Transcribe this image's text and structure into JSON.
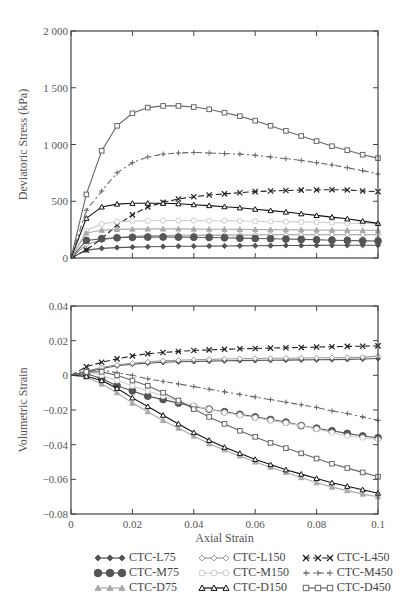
{
  "chart_data": [
    {
      "type": "line",
      "title": "",
      "xlabel": "",
      "ylabel": "Deviatoric Stress (kPa)",
      "xlim": [
        0,
        0.1
      ],
      "ylim": [
        0,
        2000
      ],
      "yticks": [
        0,
        500,
        1000,
        1500,
        2000
      ],
      "ytick_labels": [
        "0",
        "500",
        "1 000",
        "1 500",
        "2 000"
      ],
      "xticks": [
        0,
        0.02,
        0.04,
        0.06,
        0.08,
        0.1
      ],
      "grid": false,
      "x": [
        0,
        0.005,
        0.01,
        0.015,
        0.02,
        0.025,
        0.03,
        0.035,
        0.04,
        0.045,
        0.05,
        0.055,
        0.06,
        0.065,
        0.07,
        0.075,
        0.08,
        0.085,
        0.09,
        0.095,
        0.1
      ],
      "series": [
        {
          "name": "CTC-L75",
          "values": [
            0,
            70,
            85,
            92,
            96,
            99,
            101,
            103,
            104,
            105,
            106,
            107,
            108,
            109,
            110,
            110,
            111,
            112,
            112,
            113,
            113
          ]
        },
        {
          "name": "CTC-L150",
          "values": [
            0,
            120,
            160,
            180,
            190,
            195,
            198,
            200,
            201,
            202,
            202,
            203,
            203,
            204,
            204,
            204,
            205,
            205,
            205,
            205,
            205
          ]
        },
        {
          "name": "CTC-L450",
          "values": [
            0,
            70,
            170,
            290,
            380,
            450,
            490,
            520,
            540,
            555,
            565,
            575,
            585,
            590,
            595,
            598,
            600,
            602,
            600,
            590,
            585
          ]
        },
        {
          "name": "CTC-M75",
          "values": [
            0,
            155,
            170,
            178,
            182,
            184,
            185,
            184,
            183,
            181,
            178,
            175,
            172,
            170,
            167,
            164,
            160,
            157,
            154,
            151,
            150
          ]
        },
        {
          "name": "CTC-M150",
          "values": [
            0,
            240,
            300,
            320,
            325,
            328,
            330,
            330,
            330,
            329,
            328,
            326,
            324,
            322,
            320,
            318,
            315,
            312,
            308,
            305,
            300
          ]
        },
        {
          "name": "CTC-M450",
          "values": [
            0,
            420,
            590,
            750,
            840,
            890,
            915,
            925,
            930,
            925,
            920,
            915,
            905,
            890,
            875,
            860,
            840,
            820,
            795,
            770,
            740
          ]
        },
        {
          "name": "CTC-D75",
          "values": [
            0,
            220,
            245,
            252,
            255,
            256,
            256,
            256,
            255,
            254,
            253,
            252,
            251,
            250,
            249,
            248,
            247,
            246,
            245,
            244,
            243
          ]
        },
        {
          "name": "CTC-D150",
          "values": [
            0,
            350,
            450,
            475,
            482,
            483,
            482,
            478,
            470,
            462,
            452,
            442,
            430,
            418,
            405,
            390,
            375,
            360,
            345,
            325,
            305
          ]
        },
        {
          "name": "CTC-D450",
          "values": [
            0,
            560,
            945,
            1165,
            1275,
            1325,
            1340,
            1340,
            1330,
            1310,
            1280,
            1250,
            1210,
            1165,
            1120,
            1075,
            1030,
            985,
            950,
            910,
            880
          ]
        }
      ]
    },
    {
      "type": "line",
      "title": "",
      "xlabel": "Axial Strain",
      "ylabel": "Volumetric Strain",
      "xlim": [
        0,
        0.1
      ],
      "ylim": [
        -0.08,
        0.04
      ],
      "yticks": [
        -0.08,
        -0.06,
        -0.04,
        -0.02,
        0,
        0.02,
        0.04
      ],
      "ytick_labels": [
        "−0.08",
        "−0.06",
        "−0.04",
        "−0.02",
        "0",
        "0.02",
        "0.04"
      ],
      "xticks": [
        0,
        0.02,
        0.04,
        0.06,
        0.08,
        0.1
      ],
      "xtick_labels": [
        "0",
        "0.02",
        "0.04",
        "0.06",
        "0.08",
        "0.1"
      ],
      "grid": false,
      "x": [
        0,
        0.005,
        0.01,
        0.015,
        0.02,
        0.025,
        0.03,
        0.035,
        0.04,
        0.045,
        0.05,
        0.055,
        0.06,
        0.065,
        0.07,
        0.075,
        0.08,
        0.085,
        0.09,
        0.095,
        0.1
      ],
      "series": [
        {
          "name": "CTC-L75",
          "values": [
            0,
            0.002,
            0.004,
            0.0055,
            0.0065,
            0.007,
            0.0075,
            0.0078,
            0.008,
            0.0082,
            0.0084,
            0.0085,
            0.0086,
            0.0087,
            0.0088,
            0.0089,
            0.009,
            0.0091,
            0.0092,
            0.0094,
            0.0097
          ]
        },
        {
          "name": "CTC-L150",
          "values": [
            0,
            0.0025,
            0.0045,
            0.006,
            0.007,
            0.0078,
            0.0083,
            0.0087,
            0.009,
            0.0092,
            0.0094,
            0.0096,
            0.0097,
            0.0098,
            0.0099,
            0.01,
            0.0101,
            0.0102,
            0.0103,
            0.0105,
            0.011
          ]
        },
        {
          "name": "CTC-L450",
          "values": [
            0,
            0.005,
            0.0075,
            0.0095,
            0.0112,
            0.0125,
            0.0132,
            0.0138,
            0.0143,
            0.0147,
            0.015,
            0.0153,
            0.0155,
            0.0157,
            0.0159,
            0.0161,
            0.0163,
            0.0165,
            0.0167,
            0.0168,
            0.017
          ]
        },
        {
          "name": "CTC-M75",
          "values": [
            0,
            0.001,
            -0.002,
            -0.006,
            -0.009,
            -0.012,
            -0.014,
            -0.016,
            -0.018,
            -0.0195,
            -0.021,
            -0.0225,
            -0.024,
            -0.0255,
            -0.027,
            -0.029,
            -0.0305,
            -0.032,
            -0.0335,
            -0.035,
            -0.036
          ]
        },
        {
          "name": "CTC-M150",
          "values": [
            0,
            0.002,
            0.0,
            -0.003,
            -0.006,
            -0.009,
            -0.012,
            -0.015,
            -0.0175,
            -0.0195,
            -0.0215,
            -0.023,
            -0.0245,
            -0.026,
            -0.0275,
            -0.029,
            -0.031,
            -0.033,
            -0.035,
            -0.036,
            -0.037
          ]
        },
        {
          "name": "CTC-M450",
          "values": [
            0,
            0.003,
            0.003,
            0.0015,
            0.0,
            -0.002,
            -0.0035,
            -0.005,
            -0.0065,
            -0.008,
            -0.0095,
            -0.011,
            -0.0125,
            -0.014,
            -0.0155,
            -0.017,
            -0.0185,
            -0.0205,
            -0.022,
            -0.024,
            -0.026
          ]
        },
        {
          "name": "CTC-D75",
          "values": [
            0,
            -0.001,
            -0.005,
            -0.01,
            -0.016,
            -0.021,
            -0.026,
            -0.0305,
            -0.035,
            -0.0395,
            -0.043,
            -0.0465,
            -0.05,
            -0.053,
            -0.056,
            -0.059,
            -0.062,
            -0.0645,
            -0.0665,
            -0.0685,
            -0.07
          ]
        },
        {
          "name": "CTC-D150",
          "values": [
            0,
            -0.0005,
            -0.003,
            -0.0075,
            -0.013,
            -0.018,
            -0.023,
            -0.028,
            -0.033,
            -0.0375,
            -0.0415,
            -0.045,
            -0.0485,
            -0.0515,
            -0.0545,
            -0.057,
            -0.0595,
            -0.062,
            -0.064,
            -0.066,
            -0.068
          ]
        },
        {
          "name": "CTC-D450",
          "values": [
            0,
            0.002,
            0.002,
            0.0,
            -0.003,
            -0.006,
            -0.01,
            -0.0145,
            -0.0195,
            -0.024,
            -0.028,
            -0.032,
            -0.0355,
            -0.039,
            -0.042,
            -0.045,
            -0.048,
            -0.051,
            -0.0535,
            -0.056,
            -0.0585
          ]
        }
      ]
    }
  ],
  "legend": {
    "entries": [
      {
        "name": "CTC-L75",
        "marker": "diamond-filled",
        "color": "#555555",
        "dash": ""
      },
      {
        "name": "CTC-L150",
        "marker": "diamond-open",
        "color": "#999999",
        "dash": ""
      },
      {
        "name": "CTC-L450",
        "marker": "x",
        "color": "#222222",
        "dash": "6,3"
      },
      {
        "name": "CTC-M75",
        "marker": "circle-filled",
        "color": "#555555",
        "dash": ""
      },
      {
        "name": "CTC-M150",
        "marker": "circle-open",
        "color": "#cccccc",
        "dash": ""
      },
      {
        "name": "CTC-M450",
        "marker": "plus",
        "color": "#666666",
        "dash": "6,3,2,3"
      },
      {
        "name": "CTC-D75",
        "marker": "triangle-filled",
        "color": "#aaaaaa",
        "dash": ""
      },
      {
        "name": "CTC-D150",
        "marker": "triangle-open",
        "color": "#111111",
        "dash": ""
      },
      {
        "name": "CTC-D450",
        "marker": "square-open",
        "color": "#666666",
        "dash": ""
      }
    ]
  }
}
